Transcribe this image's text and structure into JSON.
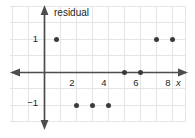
{
  "figure": {
    "title": "",
    "background_color": "#ffffff",
    "grid_color": "#e3e1e4",
    "axis_color": "#4a4a4c",
    "point_color": "#3a3a3c",
    "text_color": "#231f20"
  },
  "chart_data": {
    "type": "scatter",
    "title": "",
    "subtitle": "",
    "xlabel": "x",
    "ylabel": "residual",
    "x": [
      0.75,
      2,
      3,
      4,
      5,
      6,
      7,
      8
    ],
    "y": [
      1,
      -1,
      -1,
      -1,
      0,
      0,
      1,
      1
    ],
    "points": [
      {
        "x": 0.75,
        "y": 1
      },
      {
        "x": 2,
        "y": -1
      },
      {
        "x": 3,
        "y": -1
      },
      {
        "x": 4,
        "y": -1
      },
      {
        "x": 5,
        "y": 0
      },
      {
        "x": 6,
        "y": 0
      },
      {
        "x": 7,
        "y": 1
      },
      {
        "x": 8,
        "y": 1
      }
    ],
    "xlim": [
      -2.1,
      9.0
    ],
    "ylim": [
      -1.9,
      1.9
    ],
    "xticks": [
      2,
      4,
      6,
      8
    ],
    "xtick_labels": [
      "2",
      "4",
      "6",
      "8"
    ],
    "yticks": [
      1,
      -1
    ],
    "ytick_labels": [
      "1",
      "−1"
    ],
    "grid": true,
    "legend": null,
    "legend_position": "none",
    "annotations": []
  },
  "axis_labels": {
    "y_axis_title": "residual",
    "x_axis_variable": "x"
  },
  "icons": {
    "y_axis_arrow_up": "arrow-up-icon",
    "y_axis_arrow_down": "arrow-down-icon",
    "x_axis_arrow_left": "arrow-left-icon",
    "x_axis_arrow_right": "arrow-right-icon"
  }
}
